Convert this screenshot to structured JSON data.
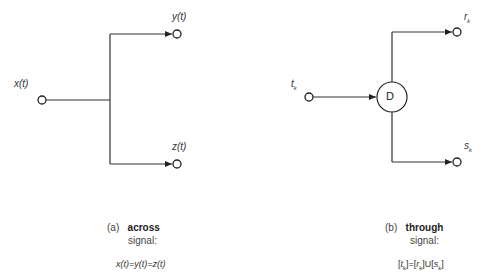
{
  "diagram_a": {
    "input_label": "x(t)",
    "output_top_label": "y(t)",
    "output_bottom_label": "z(t)",
    "caption_prefix": "(a)",
    "caption_bold": "across",
    "caption_line2": "signal:",
    "equation": "x(t)=y(t)=z(t)"
  },
  "diagram_b": {
    "input_label": "t",
    "input_sub": "k",
    "node_label": "D",
    "output_top_label": "r",
    "output_top_sub": "k",
    "output_bottom_label": "s",
    "output_bottom_sub": "k",
    "caption_prefix": "(b)",
    "caption_bold": "through",
    "caption_line2": "signal:",
    "equation": "[tk]=[rk]U[sk]"
  }
}
